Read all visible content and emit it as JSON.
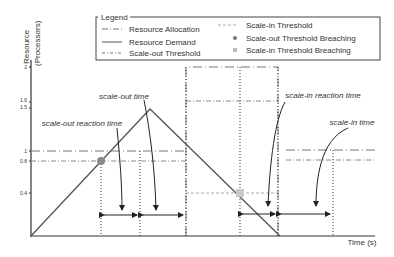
{
  "axes": {
    "y_label_line1": "Resource",
    "y_label_line2": "(Processors)",
    "x_label": "Time (s)",
    "y_ticks": [
      {
        "label": "2",
        "value": 2
      },
      {
        "label": "1.6",
        "value": 1.6
      },
      {
        "label": "1.5",
        "value": 1.5
      },
      {
        "label": "1",
        "value": 1
      },
      {
        "label": "0.8",
        "value": 0.8
      },
      {
        "label": "0.4",
        "value": 0.4
      }
    ]
  },
  "legend": {
    "title": "Legend",
    "items": [
      {
        "label": "Resource Allocation",
        "style": "dash-dot-long"
      },
      {
        "label": "Resource Demand",
        "style": "solid"
      },
      {
        "label": "Scale-out Threshold",
        "style": "dash-dot"
      },
      {
        "label": "Scale-in Threshold",
        "style": "dashed"
      },
      {
        "label": "Scale-out Threshold Breaching",
        "style": "circle-marker"
      },
      {
        "label": "Scale-in Threshold Breaching",
        "style": "square-marker"
      }
    ]
  },
  "annotations": {
    "scale_out_time": "scale-out time",
    "scale_out_reaction_time": "scale-out reaction time",
    "scale_in_reaction_time": "scale-in reaction time",
    "scale_in_time": "scale-in time"
  },
  "colors": {
    "line": "#555555",
    "marker_circle": "#8a8a8a",
    "marker_square": "#c8c8c8",
    "scale_in": "#aaaaaa"
  }
}
